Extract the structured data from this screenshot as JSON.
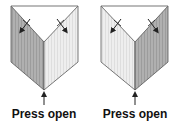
{
  "figures": [
    {
      "id": "left",
      "caption": "Press open",
      "shaded_face": "left",
      "apex_x": 44
    },
    {
      "id": "right",
      "caption": "Press open",
      "shaded_face": "right",
      "apex_x": 135
    }
  ],
  "colors": {
    "outline": "#444444",
    "dark_face": "#b0b0b0",
    "dark_stripe": "#9c9c9c",
    "light_face": "#ececec",
    "light_stripe": "#dcdcdc",
    "arrow": "#222222"
  }
}
